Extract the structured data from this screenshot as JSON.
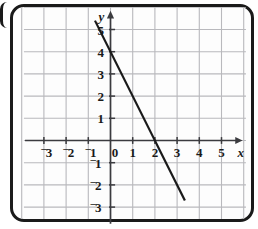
{
  "figure": {
    "background_color": "#ffffff",
    "card_background": "#fdfdfd",
    "frame_color": "#1a1a1a",
    "grid_color": "#b9b9bd",
    "axis_color": "#3b3b3f",
    "line_color": "#1a1a1a"
  },
  "chart_data": {
    "type": "line",
    "title": "",
    "xlabel": "x",
    "ylabel": "y",
    "grid": true,
    "legend": null,
    "xlim": [
      -3.6,
      5.9
    ],
    "ylim": [
      -3.6,
      5.9
    ],
    "xticks": [
      -3,
      -2,
      -1,
      0,
      1,
      2,
      3,
      4,
      5
    ],
    "yticks": [
      -3,
      -2,
      -1,
      1,
      2,
      3,
      4,
      5
    ],
    "xtick_labels": [
      "⁻3",
      "⁻2",
      "⁻1",
      "0",
      "1",
      "2",
      "3",
      "4",
      "5"
    ],
    "ytick_labels": [
      "⁻3",
      "⁻2",
      "⁻1",
      "1",
      "2",
      "3",
      "4",
      "5"
    ],
    "origin_label": "0",
    "series": [
      {
        "name": "line",
        "equation": "y = -2x + 4",
        "slope": -2,
        "y_intercept": 4,
        "x_intercept": 2,
        "x": [
          -0.7,
          3.35
        ],
        "y": [
          5.4,
          -2.7
        ]
      }
    ],
    "axis_arrows": [
      "x-positive",
      "y-positive"
    ]
  },
  "labels": {
    "x_axis": "x",
    "y_axis": "y",
    "x_ticks": [
      {
        "value": -3,
        "sign": "⁻",
        "digit": "3"
      },
      {
        "value": -2,
        "sign": "⁻",
        "digit": "2"
      },
      {
        "value": -1,
        "sign": "⁻",
        "digit": "1"
      },
      {
        "value": 0,
        "sign": "",
        "digit": "0"
      },
      {
        "value": 1,
        "sign": "",
        "digit": "1"
      },
      {
        "value": 2,
        "sign": "",
        "digit": "2"
      },
      {
        "value": 3,
        "sign": "",
        "digit": "3"
      },
      {
        "value": 4,
        "sign": "",
        "digit": "4"
      },
      {
        "value": 5,
        "sign": "",
        "digit": "5"
      }
    ],
    "y_ticks": [
      {
        "value": 5,
        "sign": "",
        "digit": "5"
      },
      {
        "value": 4,
        "sign": "",
        "digit": "4"
      },
      {
        "value": 3,
        "sign": "",
        "digit": "3"
      },
      {
        "value": 2,
        "sign": "",
        "digit": "2"
      },
      {
        "value": 1,
        "sign": "",
        "digit": "1"
      },
      {
        "value": -1,
        "sign": "⁻",
        "digit": "1"
      },
      {
        "value": -2,
        "sign": "⁻",
        "digit": "2"
      },
      {
        "value": -3,
        "sign": "⁻",
        "digit": "3"
      }
    ]
  }
}
